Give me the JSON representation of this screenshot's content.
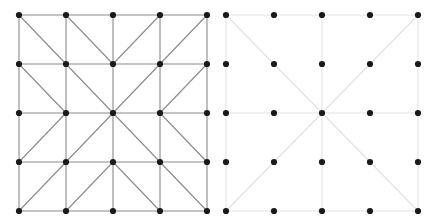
{
  "figure": {
    "background_color": "#ffffff",
    "width": 435,
    "height": 222
  },
  "panels": [
    {
      "id": "left-panel",
      "name": "fully-triangulated-mesh",
      "label": "Fully triangulated 4x4 quadrilateral mesh",
      "edge_color": "#8a8a8a",
      "edge_width": 1.1,
      "node_color": "#1a1a1a",
      "node_radius": 3.1,
      "origin_x": 19,
      "origin_y": 15,
      "step_x": 47,
      "step_y": 49,
      "cols": 5,
      "rows": 5
    },
    {
      "id": "right-panel",
      "name": "coarse-cross-mesh",
      "label": "Coarse mesh with center cross and main diagonals",
      "edge_color": "#e2e2e2",
      "edge_width": 1.1,
      "node_color": "#1a1a1a",
      "node_radius": 3.1,
      "origin_x": 226,
      "origin_y": 15,
      "step_x": 48,
      "step_y": 49,
      "cols": 5,
      "rows": 5
    }
  ],
  "chart_data": {
    "type": "diagram",
    "xlabel": "",
    "ylabel": "",
    "grid": false,
    "legend": "none",
    "panel_count": 2,
    "left_mesh": {
      "name": "fully-triangulated-mesh",
      "grid_cols": 5,
      "grid_rows": 5,
      "node_count": 25,
      "nodes": [
        [
          0,
          0
        ],
        [
          1,
          0
        ],
        [
          2,
          0
        ],
        [
          3,
          0
        ],
        [
          4,
          0
        ],
        [
          0,
          1
        ],
        [
          1,
          1
        ],
        [
          2,
          1
        ],
        [
          3,
          1
        ],
        [
          4,
          1
        ],
        [
          0,
          2
        ],
        [
          1,
          2
        ],
        [
          2,
          2
        ],
        [
          3,
          2
        ],
        [
          4,
          2
        ],
        [
          0,
          3
        ],
        [
          1,
          3
        ],
        [
          2,
          3
        ],
        [
          3,
          3
        ],
        [
          4,
          3
        ],
        [
          0,
          4
        ],
        [
          1,
          4
        ],
        [
          2,
          4
        ],
        [
          3,
          4
        ],
        [
          4,
          4
        ]
      ],
      "horizontal_rows": [
        0,
        1,
        2,
        3,
        4
      ],
      "vertical_cols": [
        0,
        1,
        2,
        3,
        4
      ],
      "cell_diagonals": [
        {
          "cell": [
            0,
            0
          ],
          "direction": "nw-se"
        },
        {
          "cell": [
            1,
            0
          ],
          "direction": "nw-se"
        },
        {
          "cell": [
            2,
            0
          ],
          "direction": "sw-ne"
        },
        {
          "cell": [
            3,
            0
          ],
          "direction": "sw-ne"
        },
        {
          "cell": [
            0,
            1
          ],
          "direction": "nw-se"
        },
        {
          "cell": [
            1,
            1
          ],
          "direction": "nw-se"
        },
        {
          "cell": [
            2,
            1
          ],
          "direction": "sw-ne"
        },
        {
          "cell": [
            3,
            1
          ],
          "direction": "sw-ne"
        },
        {
          "cell": [
            0,
            2
          ],
          "direction": "sw-ne"
        },
        {
          "cell": [
            1,
            2
          ],
          "direction": "sw-ne"
        },
        {
          "cell": [
            2,
            2
          ],
          "direction": "nw-se"
        },
        {
          "cell": [
            3,
            2
          ],
          "direction": "nw-se"
        },
        {
          "cell": [
            0,
            3
          ],
          "direction": "sw-ne"
        },
        {
          "cell": [
            1,
            3
          ],
          "direction": "sw-ne"
        },
        {
          "cell": [
            2,
            3
          ],
          "direction": "nw-se"
        },
        {
          "cell": [
            3,
            3
          ],
          "direction": "nw-se"
        }
      ],
      "triangle_count": 32
    },
    "right_mesh": {
      "name": "coarse-cross-mesh",
      "grid_cols": 5,
      "grid_rows": 5,
      "node_count": 25,
      "nodes": [
        [
          0,
          0
        ],
        [
          1,
          0
        ],
        [
          2,
          0
        ],
        [
          3,
          0
        ],
        [
          4,
          0
        ],
        [
          0,
          1
        ],
        [
          1,
          1
        ],
        [
          2,
          1
        ],
        [
          3,
          1
        ],
        [
          4,
          1
        ],
        [
          0,
          2
        ],
        [
          1,
          2
        ],
        [
          2,
          2
        ],
        [
          3,
          2
        ],
        [
          4,
          2
        ],
        [
          0,
          3
        ],
        [
          1,
          3
        ],
        [
          2,
          3
        ],
        [
          3,
          3
        ],
        [
          4,
          3
        ],
        [
          0,
          4
        ],
        [
          1,
          4
        ],
        [
          2,
          4
        ],
        [
          3,
          4
        ],
        [
          4,
          4
        ]
      ],
      "horizontal_rows": [
        0,
        2,
        4
      ],
      "vertical_cols": [
        0,
        2,
        4
      ],
      "main_diagonals": [
        {
          "from": [
            0,
            0
          ],
          "to": [
            4,
            4
          ],
          "direction": "nw-se"
        },
        {
          "from": [
            0,
            4
          ],
          "to": [
            4,
            0
          ],
          "direction": "sw-ne"
        }
      ],
      "triangle_count": 4
    }
  }
}
